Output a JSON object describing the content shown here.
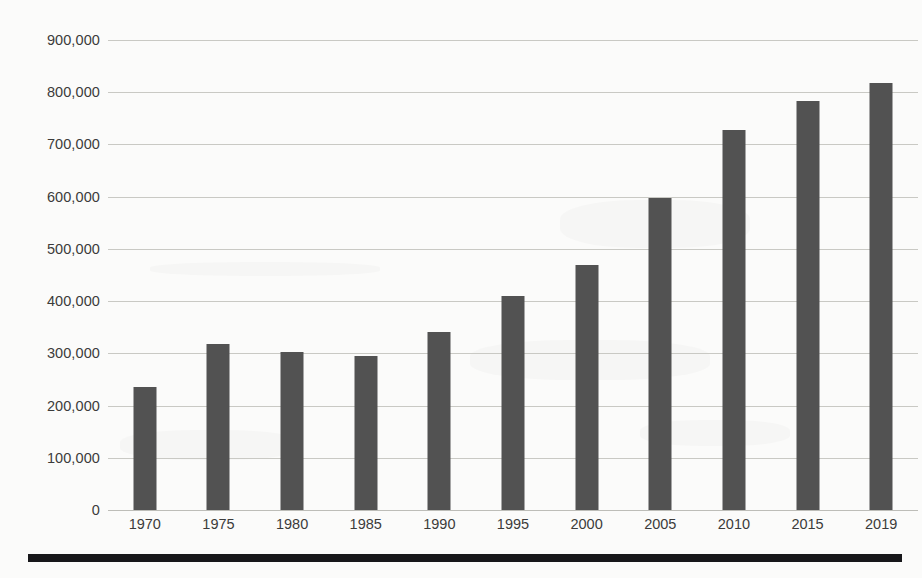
{
  "chart_data": {
    "type": "bar",
    "title": "",
    "xlabel": "",
    "ylabel": "",
    "categories": [
      "1970",
      "1975",
      "1980",
      "1985",
      "1990",
      "1995",
      "2000",
      "2005",
      "2010",
      "2015",
      "2019"
    ],
    "values": [
      235000,
      317000,
      302000,
      295000,
      341000,
      410000,
      470000,
      598000,
      727000,
      783000,
      818000
    ],
    "series": [
      {
        "name": "",
        "values": [
          235000,
          317000,
          302000,
          295000,
          341000,
          410000,
          470000,
          598000,
          727000,
          783000,
          818000
        ]
      }
    ],
    "ylim": [
      0,
      900000
    ],
    "ytick_values": [
      0,
      100000,
      200000,
      300000,
      400000,
      500000,
      600000,
      700000,
      800000,
      900000
    ],
    "ytick_labels": [
      "0",
      "100,000",
      "200,000",
      "300,000",
      "400,000",
      "500,000",
      "600,000",
      "700,000",
      "800,000",
      "900,000"
    ],
    "xtick_labels": [
      "1970",
      "1975",
      "1980",
      "1985",
      "1990",
      "1995",
      "2000",
      "2005",
      "2010",
      "2015",
      "2019"
    ],
    "grid": true,
    "grid_axis": "y",
    "legend": false,
    "legend_position": "none",
    "annotations": [],
    "colors": {
      "bar_fill": "#525252",
      "gridline": "#c9c9c4",
      "tick_label": "#3b3b3b",
      "background": "#fbfbfa",
      "bottom_rule": "#17171a"
    }
  },
  "footer": {
    "rule_present": true
  }
}
